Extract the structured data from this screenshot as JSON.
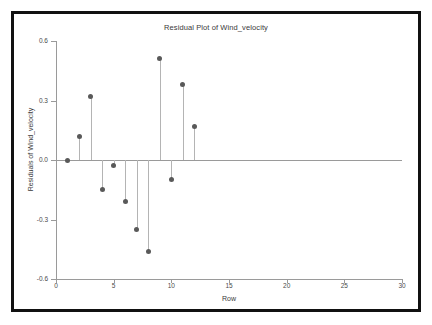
{
  "chart_data": {
    "type": "scatter",
    "title": "Residual Plot of Wind_velocity",
    "xlabel": "Row",
    "ylabel": "Residuals of Wind_velocity",
    "x": [
      1,
      2,
      3,
      4,
      5,
      6,
      7,
      8,
      9,
      10,
      11,
      12
    ],
    "values": [
      0.0,
      0.12,
      0.32,
      -0.15,
      -0.03,
      -0.21,
      -0.35,
      -0.46,
      0.51,
      -0.1,
      0.38,
      0.17
    ],
    "series": [
      {
        "name": "Residuals of Wind_velocity",
        "values": [
          0.0,
          0.12,
          0.32,
          -0.15,
          -0.03,
          -0.21,
          -0.35,
          -0.46,
          0.51,
          -0.1,
          0.38,
          0.17
        ]
      }
    ],
    "xlim": [
      0,
      30
    ],
    "ylim": [
      -0.6,
      0.6
    ],
    "xticks": [
      0,
      5,
      10,
      15,
      20,
      25,
      30
    ],
    "xtick_labels": [
      "0",
      "5",
      "10",
      "15",
      "20",
      "25",
      "30"
    ],
    "yticks": [
      0.6,
      0.3,
      0.0,
      -0.3,
      -0.6
    ],
    "ytick_labels": [
      "0.6",
      "0.3",
      "0.0",
      "-0.3",
      "-0.6"
    ],
    "grid": false,
    "legend": null,
    "reference_line": 0.0,
    "marker_color": "#595959",
    "stem_color": "#b4b4b4",
    "axis_color": "#9a9a9a",
    "frame_color": "#111111",
    "background_color": "#ffffff"
  }
}
